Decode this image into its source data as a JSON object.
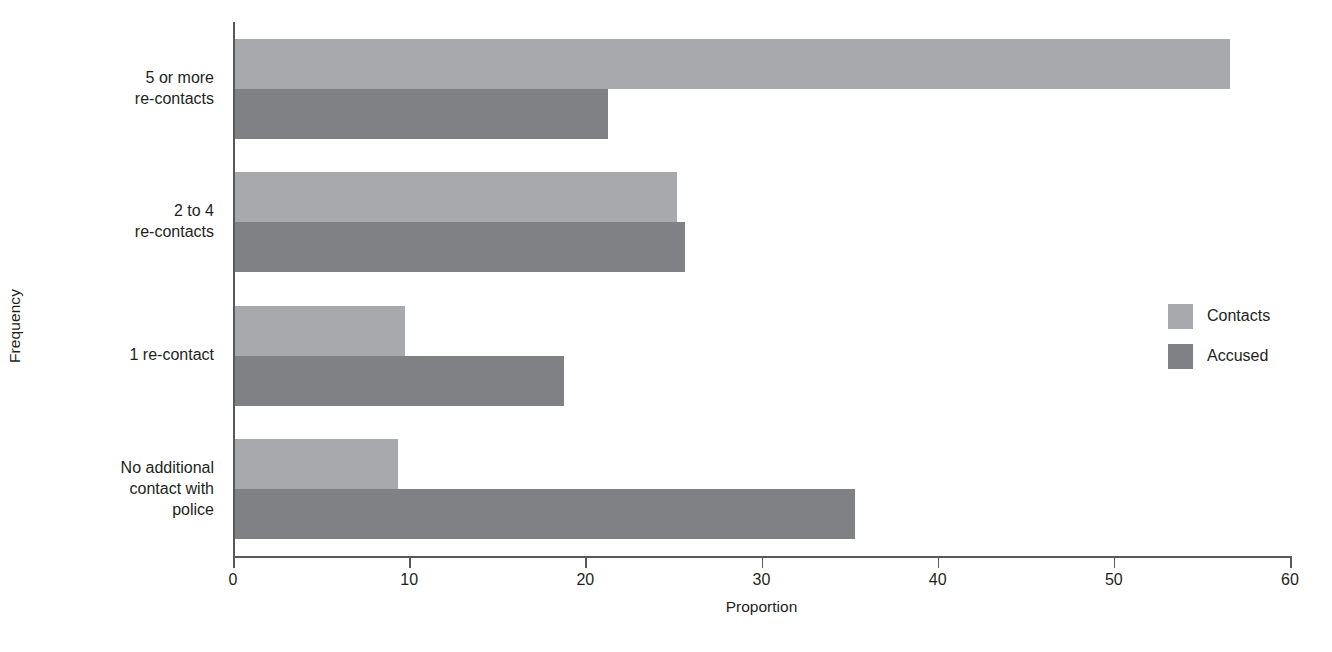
{
  "chart_data": {
    "type": "bar",
    "orientation": "horizontal",
    "title": "",
    "xlabel": "Proportion",
    "ylabel": "Frequency",
    "xlim": [
      0,
      60
    ],
    "xticks": [
      0,
      10,
      20,
      30,
      40,
      50,
      60
    ],
    "xtick_labels": [
      "0",
      "10",
      "20",
      "30",
      "40",
      "50",
      "60"
    ],
    "grid": false,
    "legend_position": "right",
    "categories": [
      "No additional\ncontact with\npolice",
      "1 re-contact",
      "2 to 4\nre-contacts",
      "5 or more\nre-contacts"
    ],
    "series": [
      {
        "name": "Contacts",
        "color": "#a7a9ac",
        "values": [
          9.3,
          9.7,
          25.1,
          56.5
        ]
      },
      {
        "name": "Accused",
        "color": "#808184",
        "values": [
          35.2,
          18.7,
          25.6,
          21.2
        ]
      }
    ]
  },
  "legend": {
    "items": [
      {
        "label": "Contacts",
        "color": "#a7a9ac"
      },
      {
        "label": "Accused",
        "color": "#808184"
      }
    ]
  },
  "colors": {
    "contacts": "#a7a9ac",
    "accused": "#808184",
    "axis": "#58595b",
    "text": "#231f20",
    "background": "#ffffff"
  }
}
